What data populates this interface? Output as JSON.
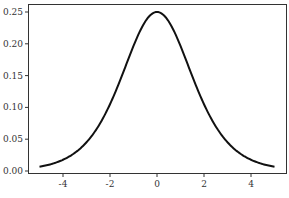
{
  "chart_data": {
    "type": "line",
    "title": "",
    "xlabel": "",
    "ylabel": "",
    "xlim": [
      -5.5,
      5.5
    ],
    "ylim": [
      -0.005,
      0.262
    ],
    "grid": false,
    "legend": null,
    "x_ticks": [
      -4,
      -2,
      0,
      2,
      4
    ],
    "x_tick_labels": [
      "-4",
      "-2",
      "0",
      "2",
      "4"
    ],
    "y_ticks": [
      0.0,
      0.05,
      0.1,
      0.15,
      0.2,
      0.25
    ],
    "y_tick_labels": [
      "0.00",
      "0.05",
      "0.10",
      "0.15",
      "0.20",
      "0.25"
    ],
    "series": [
      {
        "name": "logistic pdf",
        "color": "#111111",
        "x": [
          -5,
          -4.5,
          -4,
          -3.5,
          -3,
          -2.5,
          -2,
          -1.5,
          -1,
          -0.5,
          0,
          0.5,
          1,
          1.5,
          2,
          2.5,
          3,
          3.5,
          4,
          4.5,
          5
        ],
        "y": [
          0.0066,
          0.0108,
          0.0177,
          0.0285,
          0.0452,
          0.0701,
          0.105,
          0.1491,
          0.1966,
          0.235,
          0.25,
          0.235,
          0.1966,
          0.1491,
          0.105,
          0.0701,
          0.0452,
          0.0285,
          0.0177,
          0.0108,
          0.0066
        ]
      }
    ]
  }
}
